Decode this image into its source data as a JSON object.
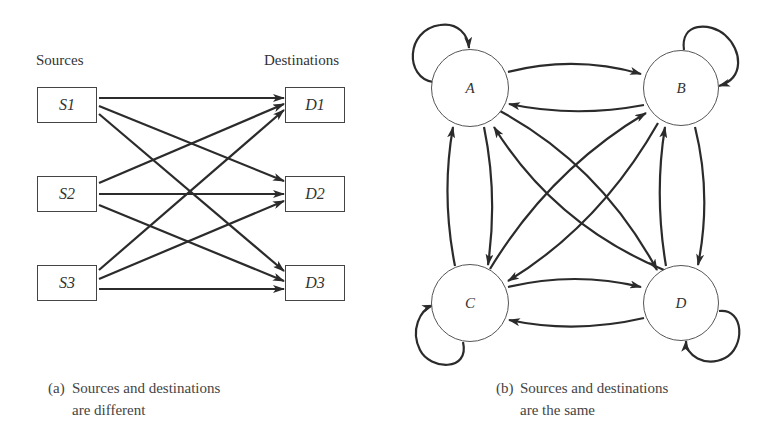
{
  "figure_a": {
    "sources_heading": "Sources",
    "destinations_heading": "Destinations",
    "sources": [
      "S1",
      "S2",
      "S3"
    ],
    "destinations": [
      "D1",
      "D2",
      "D3"
    ],
    "edges": [
      [
        "S1",
        "D1"
      ],
      [
        "S1",
        "D2"
      ],
      [
        "S1",
        "D3"
      ],
      [
        "S2",
        "D1"
      ],
      [
        "S2",
        "D2"
      ],
      [
        "S2",
        "D3"
      ],
      [
        "S3",
        "D1"
      ],
      [
        "S3",
        "D2"
      ],
      [
        "S3",
        "D3"
      ]
    ],
    "caption_tag": "(a)",
    "caption_line1": "Sources and destinations",
    "caption_line2": "are different"
  },
  "figure_b": {
    "nodes": [
      "A",
      "B",
      "C",
      "D"
    ],
    "edges": [
      [
        "A",
        "A"
      ],
      [
        "B",
        "B"
      ],
      [
        "C",
        "C"
      ],
      [
        "D",
        "D"
      ],
      [
        "A",
        "B"
      ],
      [
        "B",
        "A"
      ],
      [
        "A",
        "C"
      ],
      [
        "C",
        "A"
      ],
      [
        "A",
        "D"
      ],
      [
        "D",
        "A"
      ],
      [
        "B",
        "C"
      ],
      [
        "C",
        "B"
      ],
      [
        "B",
        "D"
      ],
      [
        "D",
        "B"
      ],
      [
        "C",
        "D"
      ],
      [
        "D",
        "C"
      ]
    ],
    "caption_tag": "(b)",
    "caption_line1": "Sources and destinations",
    "caption_line2": "are the same"
  },
  "colors": {
    "stroke": "#2b2b2b",
    "background": "#ffffff",
    "text": "#333333"
  }
}
